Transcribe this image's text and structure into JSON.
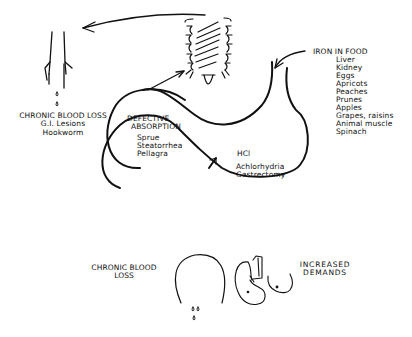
{
  "diagram": {
    "labels": {
      "chronic_blood_loss_top": {
        "heading": "CHRONIC BLOOD LOSS",
        "lines": [
          "G.I. Lesions",
          "Hookworm"
        ]
      },
      "defective_absorption": {
        "heading_line1": "DEFECTIVE",
        "heading_line2": "ABSORPTION",
        "items": [
          "Sprue",
          "Steatorrhea",
          "Pellagra"
        ]
      },
      "hcl": "HCl",
      "stomach_causes": [
        "Achlorhydria",
        "Gastrectomy"
      ],
      "iron_in_food": {
        "heading": "IRON IN FOOD",
        "items": [
          "Liver",
          "Kidney",
          "Eggs",
          "Apricots",
          "Peaches",
          "Prunes",
          "Apples",
          "Grapes, raisins",
          "Animal muscle",
          "Spinach"
        ]
      },
      "chronic_blood_loss_bottom": {
        "line1": "CHRONIC BLOOD",
        "line2": "LOSS"
      },
      "increased_demands": {
        "line1": "INCREASED",
        "line2": "DEMANDS"
      }
    },
    "figures": [
      "intestine-segment",
      "villi",
      "stomach",
      "uterus",
      "fetus",
      "breast"
    ],
    "colors": {
      "ink": "#111111",
      "background": "#ffffff"
    }
  }
}
